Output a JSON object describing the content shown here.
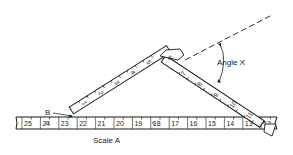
{
  "diagram": {
    "labels": {
      "angle": "Angle X",
      "point_b": "B",
      "scale": "Scale A"
    },
    "scale_a": {
      "numbers": [
        "25",
        "24",
        "23",
        "22",
        "21",
        "20",
        "19",
        "18",
        "17",
        "16",
        "15",
        "14",
        "13",
        "12"
      ]
    },
    "left_arm": {
      "numbers": [
        "1",
        "2",
        "3",
        "4",
        "5"
      ]
    },
    "hinge_number": "6",
    "right_arm": {
      "numbers": [
        "7",
        "8",
        "9",
        "10",
        "11"
      ]
    },
    "colors": {
      "ink": "#1a1a1a",
      "paper": "#ffffff"
    }
  }
}
